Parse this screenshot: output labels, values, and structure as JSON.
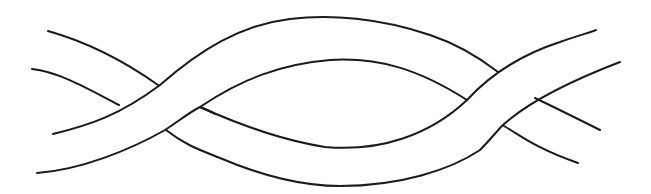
{
  "illustration": {
    "subject": "two intertwined bands (twisted ribbon / braid line drawing)",
    "background_color": "#ffffff",
    "line_color": "#1a1a1a",
    "crossings": 2
  }
}
